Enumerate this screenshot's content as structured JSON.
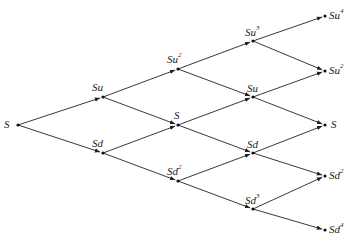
{
  "diagram": {
    "type": "binomial-tree",
    "steps": 4,
    "nodes": [
      {
        "id": "n0",
        "base": "S",
        "exp": "",
        "x": 18,
        "y": 125,
        "lx": 4,
        "ly": 119
      },
      {
        "id": "n1u",
        "base": "Su",
        "exp": "",
        "x": 103,
        "y": 97,
        "lx": 92,
        "ly": 82
      },
      {
        "id": "n1d",
        "base": "Sd",
        "exp": "",
        "x": 103,
        "y": 153,
        "lx": 92,
        "ly": 138
      },
      {
        "id": "n2uu",
        "base": "Su",
        "exp": "2",
        "x": 178,
        "y": 69,
        "lx": 167,
        "ly": 54
      },
      {
        "id": "n2ud",
        "base": "S",
        "exp": "",
        "x": 178,
        "y": 125,
        "lx": 174,
        "ly": 110
      },
      {
        "id": "n2dd",
        "base": "Sd",
        "exp": "2",
        "x": 178,
        "y": 181,
        "lx": 167,
        "ly": 166
      },
      {
        "id": "n3u3",
        "base": "Su",
        "exp": "3",
        "x": 253,
        "y": 41,
        "lx": 245,
        "ly": 27
      },
      {
        "id": "n3u",
        "base": "Su",
        "exp": "",
        "x": 253,
        "y": 97,
        "lx": 247,
        "ly": 83
      },
      {
        "id": "n3d",
        "base": "Sd",
        "exp": "",
        "x": 253,
        "y": 153,
        "lx": 247,
        "ly": 139
      },
      {
        "id": "n3d3",
        "base": "Sd",
        "exp": "3",
        "x": 253,
        "y": 209,
        "lx": 245,
        "ly": 195
      },
      {
        "id": "n4u4",
        "base": "Su",
        "exp": "4",
        "x": 325,
        "y": 16,
        "lx": 329,
        "ly": 10
      },
      {
        "id": "n4u2",
        "base": "Su",
        "exp": "2",
        "x": 325,
        "y": 71,
        "lx": 329,
        "ly": 65
      },
      {
        "id": "n4s",
        "base": "S",
        "exp": "",
        "x": 325,
        "y": 125,
        "lx": 331,
        "ly": 119
      },
      {
        "id": "n4d2",
        "base": "Sd",
        "exp": "2",
        "x": 325,
        "y": 176,
        "lx": 329,
        "ly": 170
      },
      {
        "id": "n4d4",
        "base": "Sd",
        "exp": "4",
        "x": 325,
        "y": 230,
        "lx": 329,
        "ly": 224
      }
    ],
    "edges": [
      [
        "n0",
        "n1u"
      ],
      [
        "n0",
        "n1d"
      ],
      [
        "n1u",
        "n2uu"
      ],
      [
        "n1u",
        "n2ud"
      ],
      [
        "n1d",
        "n2ud"
      ],
      [
        "n1d",
        "n2dd"
      ],
      [
        "n2uu",
        "n3u3"
      ],
      [
        "n2uu",
        "n3u"
      ],
      [
        "n2ud",
        "n3u"
      ],
      [
        "n2ud",
        "n3d"
      ],
      [
        "n2dd",
        "n3d"
      ],
      [
        "n2dd",
        "n3d3"
      ],
      [
        "n3u3",
        "n4u4"
      ],
      [
        "n3u3",
        "n4u2"
      ],
      [
        "n3u",
        "n4u2"
      ],
      [
        "n3u",
        "n4s"
      ],
      [
        "n3d",
        "n4s"
      ],
      [
        "n3d",
        "n4d2"
      ],
      [
        "n3d3",
        "n4d2"
      ],
      [
        "n3d3",
        "n4d4"
      ]
    ],
    "colors": {
      "line": "#222222",
      "node": "#111111",
      "background": "#ffffff"
    }
  }
}
